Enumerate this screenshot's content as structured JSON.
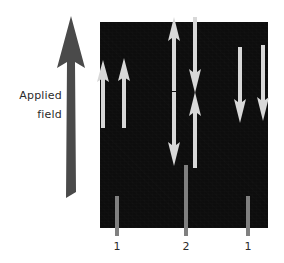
{
  "figure": {
    "width": 284,
    "height": 263,
    "background_color": "#ffffff",
    "type": "magnetic-domain-diagram"
  },
  "applied_field": {
    "label_line_1": "Applied",
    "label_line_2": "field",
    "arrow_direction": "up",
    "arrow_color": "#4a4a4a",
    "text_color": "#2b2b2b"
  },
  "specimen": {
    "block_color": "#0d0d0d",
    "arrow_color": "#d8d8d8",
    "x": 100,
    "y": 22,
    "width": 168,
    "height": 206
  },
  "domain_arrows": [
    {
      "name": "domain-arrow-1",
      "direction": "up",
      "x": 96,
      "y": 60,
      "length": 68,
      "clipped": "left-edge"
    },
    {
      "name": "domain-arrow-2",
      "direction": "up",
      "x": 117,
      "y": 58,
      "length": 70,
      "clipped": "none"
    },
    {
      "name": "domain-arrow-3",
      "direction": "up",
      "x": 167,
      "y": 17,
      "length": 74,
      "clipped": "top"
    },
    {
      "name": "domain-arrow-4",
      "direction": "down",
      "x": 167,
      "y": 92,
      "length": 74,
      "clipped": "none"
    },
    {
      "name": "domain-arrow-5",
      "direction": "down",
      "x": 188,
      "y": 17,
      "length": 76,
      "clipped": "top"
    },
    {
      "name": "domain-arrow-6",
      "direction": "up",
      "x": 188,
      "y": 92,
      "length": 76,
      "clipped": "none"
    },
    {
      "name": "domain-arrow-7",
      "direction": "down",
      "x": 233,
      "y": 47,
      "length": 76,
      "clipped": "none"
    },
    {
      "name": "domain-arrow-8",
      "direction": "down",
      "x": 256,
      "y": 45,
      "length": 76,
      "clipped": "right-edge"
    }
  ],
  "wall_markers": [
    {
      "name": "wall-marker-left",
      "label": "1",
      "x": 115,
      "top": 196,
      "height": 40,
      "color": "#808080"
    },
    {
      "name": "wall-marker-middle",
      "label": "2",
      "x": 184,
      "top": 165,
      "height": 71,
      "color": "#808080"
    },
    {
      "name": "wall-marker-right",
      "label": "1",
      "x": 246,
      "top": 196,
      "height": 40,
      "color": "#808080"
    }
  ],
  "wall_label_baseline_y": 243
}
